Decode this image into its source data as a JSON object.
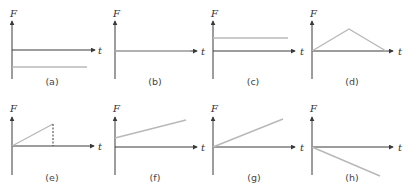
{
  "figure": {
    "y_axis_label": "F",
    "x_axis_label": "t",
    "line_color": "#b8b8b8",
    "axis_color": "#3a3a3a",
    "panels": [
      {
        "label": "(a)",
        "description": "constant negative force (horizontal line below t-axis)"
      },
      {
        "label": "(b)",
        "description": "zero force (line along t-axis)"
      },
      {
        "label": "(c)",
        "description": "constant positive force (horizontal line above t-axis)"
      },
      {
        "label": "(d)",
        "description": "force rises linearly from zero then falls linearly back to zero (triangle)"
      },
      {
        "label": "(e)",
        "description": "force rises linearly from zero then drops abruptly to zero (dashed vertical)"
      },
      {
        "label": "(f)",
        "description": "force increases linearly from a positive initial value"
      },
      {
        "label": "(g)",
        "description": "force increases linearly from zero"
      },
      {
        "label": "(h)",
        "description": "force decreases linearly from zero (negative slope)"
      }
    ]
  }
}
